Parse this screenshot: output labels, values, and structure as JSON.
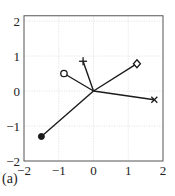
{
  "chart_data": {
    "type": "line",
    "title": "",
    "xlabel": "",
    "ylabel": "",
    "panel_label": "(a)",
    "xlim": [
      -2,
      2
    ],
    "ylim": [
      -2,
      2.15
    ],
    "grid": true,
    "xticks": [
      "-2",
      "-1",
      "0",
      "1",
      "2"
    ],
    "yticks": [
      "-2",
      "-1",
      "0",
      "1",
      "2"
    ],
    "origin": [
      0,
      0
    ],
    "series": [
      {
        "name": "plus",
        "marker": "plus",
        "x": [
          0,
          -0.3
        ],
        "y": [
          0,
          0.85
        ]
      },
      {
        "name": "circle",
        "marker": "circle",
        "x": [
          0,
          -0.85
        ],
        "y": [
          0,
          0.5
        ]
      },
      {
        "name": "diamond",
        "marker": "diamond",
        "x": [
          0,
          1.25
        ],
        "y": [
          0,
          0.78
        ]
      },
      {
        "name": "cross",
        "marker": "x",
        "x": [
          0,
          1.75
        ],
        "y": [
          0,
          -0.25
        ]
      },
      {
        "name": "filled",
        "marker": "filled-circle",
        "x": [
          0,
          -1.5
        ],
        "y": [
          0,
          -1.3
        ]
      }
    ]
  },
  "colors": {
    "line": "#1a1a1a",
    "grid": "#d8d8d8",
    "axis": "#555555"
  }
}
